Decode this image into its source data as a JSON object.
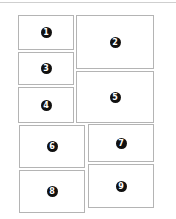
{
  "diagram": {
    "panels": [
      {
        "label": "1"
      },
      {
        "label": "2"
      },
      {
        "label": "3"
      },
      {
        "label": "4"
      },
      {
        "label": "5"
      },
      {
        "label": "6"
      },
      {
        "label": "7"
      },
      {
        "label": "8"
      },
      {
        "label": "9"
      }
    ],
    "colors": {
      "badge_bg": "#111111",
      "badge_text": "#ffffff",
      "panel_border": "#b4b4b4"
    }
  }
}
